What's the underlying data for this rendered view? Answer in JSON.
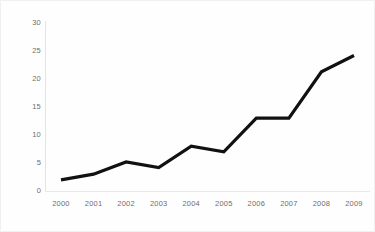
{
  "chart_data": {
    "type": "line",
    "title": "",
    "subtitle": "",
    "xlabel": "",
    "ylabel": "",
    "categories": [
      "2000",
      "2001",
      "2002",
      "2003",
      "2004",
      "2005",
      "2006",
      "2007",
      "2008",
      "2009"
    ],
    "x": [
      2000,
      2001,
      2002,
      2003,
      2004,
      2005,
      2006,
      2007,
      2008,
      2009
    ],
    "values": [
      2.0,
      3.0,
      5.2,
      4.2,
      8.0,
      7.0,
      13.0,
      13.0,
      21.3,
      24.2
    ],
    "series": [
      {
        "name": "",
        "values": [
          2.0,
          3.0,
          5.2,
          4.2,
          8.0,
          7.0,
          13.0,
          13.0,
          21.3,
          24.2
        ],
        "color": "#111111"
      }
    ],
    "ylim": [
      0,
      30
    ],
    "y_ticks": [
      0,
      5,
      10,
      15,
      20,
      25,
      30
    ],
    "y_tick_labels": [
      "0",
      "5",
      "10",
      "15",
      "20",
      "25",
      "30"
    ],
    "x_tick_labels": [
      "2000",
      "2001",
      "2002",
      "2003",
      "2004",
      "2005",
      "2006",
      "2007",
      "2008",
      "2009"
    ],
    "grid": false,
    "legend": false,
    "legend_position": "none",
    "markers": false,
    "line_width": 3,
    "annotations": [],
    "background_color": "#fefefe",
    "axis_color": "#e3e3e3",
    "tick_label_color": "#6e6e6e"
  }
}
